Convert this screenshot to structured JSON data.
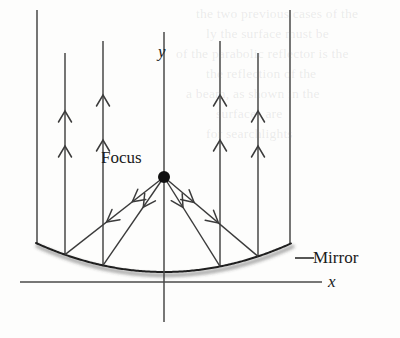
{
  "figure": {
    "kind": "optics-parabolic-mirror-diagram",
    "background_color": "#fdfdfc",
    "ink_color": "#3b3b3b",
    "axis_color": "#4a4a4a",
    "mirror_color": "#1f1f1f",
    "labels": {
      "focus": "Focus",
      "mirror": "Mirror",
      "y_axis": "y",
      "x_axis": "x"
    },
    "focus_point": {
      "x": 164,
      "y": 177,
      "radius": 6
    },
    "mirror": {
      "vertex": {
        "x": 164,
        "y": 272
      },
      "left_end": {
        "x": 36,
        "y": 243
      },
      "right_end": {
        "x": 291,
        "y": 243
      },
      "shadow": true
    },
    "y_axis": {
      "x": 164,
      "top": 32,
      "bottom": 322
    },
    "x_axis": {
      "y": 282,
      "left": 20,
      "right": 322
    },
    "mirror_leader": {
      "x1": 295,
      "y1": 258,
      "x2": 314,
      "y2": 258
    },
    "incoming_rays": [
      {
        "x": 37,
        "top": 10,
        "arrows": []
      },
      {
        "x": 65,
        "top": 53,
        "arrows": [
          146,
          111
        ]
      },
      {
        "x": 103,
        "top": 41,
        "arrows": [
          140,
          95
        ]
      },
      {
        "x": 220,
        "top": 41,
        "arrows": [
          140,
          95
        ]
      },
      {
        "x": 258,
        "top": 53,
        "arrows": [
          146,
          111
        ]
      },
      {
        "x": 290,
        "top": 10,
        "arrows": []
      }
    ],
    "reflected_rays": [
      {
        "to_x": 65,
        "to_y": 260,
        "arrows": [
          0.32,
          0.58
        ]
      },
      {
        "to_x": 103,
        "to_y": 268,
        "arrows": [
          0.34
        ]
      },
      {
        "to_x": 220,
        "to_y": 268,
        "arrows": [
          0.34
        ]
      },
      {
        "to_x": 258,
        "to_y": 260,
        "arrows": [
          0.32,
          0.58
        ]
      }
    ],
    "bleed_lines": [
      {
        "text": "the two previous cases of the",
        "x": 196,
        "y": 6
      },
      {
        "text": "ly the surface must be",
        "x": 206,
        "y": 26
      },
      {
        "text": "of the parabolic reflector is the",
        "x": 176,
        "y": 46
      },
      {
        "text": "the reflection of the",
        "x": 206,
        "y": 66
      },
      {
        "text": "a beam, as shown in the",
        "x": 186,
        "y": 86
      },
      {
        "text": "surfaces are",
        "x": 216,
        "y": 106
      },
      {
        "text": "for searchlights",
        "x": 206,
        "y": 126
      }
    ]
  }
}
